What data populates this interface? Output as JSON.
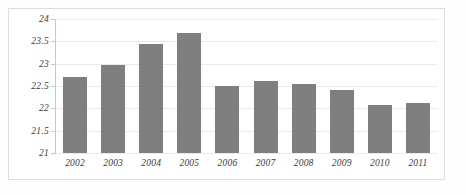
{
  "chart_data": {
    "type": "bar",
    "title": "",
    "subtitle": "",
    "xlabel": "",
    "ylabel": "",
    "categories": [
      "2002",
      "2003",
      "2004",
      "2005",
      "2006",
      "2007",
      "2008",
      "2009",
      "2010",
      "2011"
    ],
    "values": [
      22.7,
      22.98,
      23.45,
      23.68,
      22.5,
      22.62,
      22.55,
      22.42,
      22.08,
      22.13
    ],
    "series": [
      {
        "name": "",
        "values": [
          22.7,
          22.98,
          23.45,
          23.68,
          22.5,
          22.62,
          22.55,
          22.42,
          22.08,
          22.13
        ]
      }
    ],
    "ylim": [
      21,
      24
    ],
    "ytick_labels": [
      "24",
      "23.5",
      "23",
      "22.5",
      "22",
      "21.5",
      "21"
    ],
    "ytick_values": [
      24,
      23.5,
      23,
      22.5,
      22,
      21.5,
      21
    ],
    "grid": true,
    "grid_axis": "y",
    "legend": false,
    "legend_position": "none",
    "bar_color": "#7f7f7f",
    "grid_color": "#e9e9e9",
    "axis_color": "#c8c8c8",
    "text_color": "#3a3a3a",
    "background_color": "#ffffff",
    "frame_color": "#dedede",
    "annotations": []
  }
}
